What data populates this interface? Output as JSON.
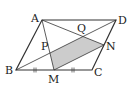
{
  "diagram": {
    "points": {
      "A": {
        "label": "A",
        "x": 42,
        "y": 20
      },
      "B": {
        "label": "B",
        "x": 16,
        "y": 70
      },
      "C": {
        "label": "C",
        "x": 92,
        "y": 70
      },
      "D": {
        "label": "D",
        "x": 116,
        "y": 20
      },
      "M": {
        "label": "M",
        "x": 54,
        "y": 70
      },
      "N": {
        "label": "N",
        "x": 104,
        "y": 45
      },
      "P": {
        "label": "P",
        "x": 50,
        "y": 53
      },
      "Q": {
        "label": "Q",
        "x": 83,
        "y": 36.5
      }
    },
    "segments": [
      "AB",
      "BC",
      "CD",
      "DA",
      "BD",
      "AM",
      "AN",
      "MN"
    ],
    "shaded_region": [
      "P",
      "Q",
      "N",
      "M"
    ],
    "equal_marks": [
      "BM",
      "MC"
    ],
    "colors": {
      "line": "#333333",
      "shade": "#cccccc"
    }
  }
}
